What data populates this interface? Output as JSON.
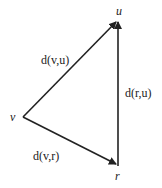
{
  "diagram": {
    "type": "triangle-inequality",
    "stroke_color": "#222222",
    "vertices": {
      "u": {
        "label": "u",
        "x": 118,
        "y": 20
      },
      "v": {
        "label": "v",
        "x": 23,
        "y": 117
      },
      "r": {
        "label": "r",
        "x": 118,
        "y": 166
      }
    },
    "edges": [
      {
        "from": "v",
        "to": "u",
        "label": "d(v,u)"
      },
      {
        "from": "r",
        "to": "u",
        "label": "d(r,u)"
      },
      {
        "from": "v",
        "to": "r",
        "label": "d(v,r)"
      }
    ]
  }
}
